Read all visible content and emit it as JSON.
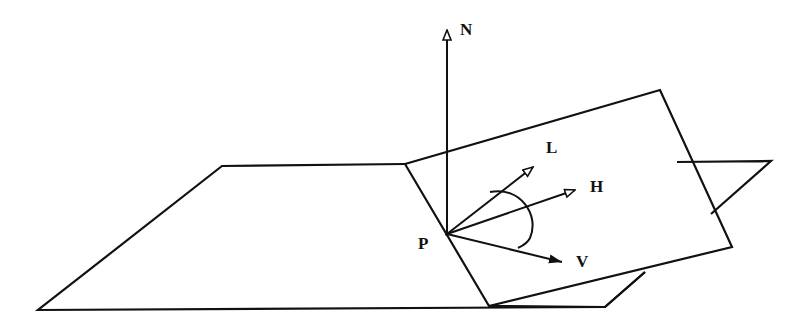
{
  "diagram": {
    "type": "reflection-geometry",
    "point_label": "P",
    "vectors": [
      {
        "id": "N",
        "label": "N",
        "meaning": "surface normal",
        "head": "open"
      },
      {
        "id": "L",
        "label": "L",
        "meaning": "light direction",
        "head": "open"
      },
      {
        "id": "H",
        "label": "H",
        "meaning": "halfway vector",
        "head": "open"
      },
      {
        "id": "V",
        "label": "V",
        "meaning": "view direction",
        "head": "filled"
      }
    ],
    "planes": [
      {
        "id": "ground-plane",
        "label": ""
      },
      {
        "id": "tilted-plane",
        "label": ""
      }
    ],
    "angle_arc": {
      "between": [
        "L",
        "V"
      ]
    }
  }
}
